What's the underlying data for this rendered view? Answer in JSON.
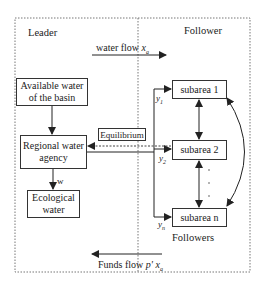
{
  "diagram": {
    "regions": {
      "leader": "Leader",
      "follower": "Follower",
      "followers": "Followers"
    },
    "nodes": {
      "available_water": "Available water of the basin",
      "available_water_l1": "Available water",
      "available_water_l2": "of the basin",
      "regional_agency_l1": "Regional water",
      "regional_agency_l2": "agency",
      "ecological_l1": "Ecological",
      "ecological_l2": "water",
      "subarea_1": "subarea 1",
      "subarea_2": "subarea 2",
      "subarea_n": "subarea n",
      "equilibrium": "Equilibrium"
    },
    "flows": {
      "water_flow_label": "water flow",
      "water_flow_var": "x",
      "water_flow_sub": "a",
      "funds_flow_label": "Funds flow",
      "funds_flow_var": "p' x",
      "funds_flow_sub": "a",
      "w_label": "w",
      "y1": "y",
      "y1_sub": "1",
      "y2": "y",
      "y2_sub": "2",
      "yn": "y",
      "yn_sub": "n"
    },
    "colors": {
      "line": "#333333",
      "dotted": "#777777",
      "background": "#ffffff"
    }
  }
}
